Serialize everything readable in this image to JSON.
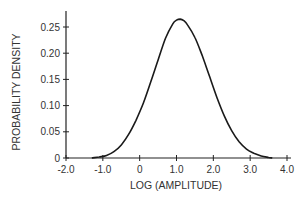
{
  "chart_data": {
    "type": "line",
    "title": "",
    "xlabel": "LOG (AMPLITUDE)",
    "ylabel": "PROBABILITY DENSITY",
    "xlim": [
      -2.0,
      4.0
    ],
    "ylim": [
      0,
      0.27
    ],
    "x_ticks": [
      -2.0,
      -1.0,
      0,
      1.0,
      2.0,
      3.0,
      4.0
    ],
    "x_tick_labels": [
      "-2.0",
      "-1.0",
      "0",
      "1.0",
      "2.0",
      "3.0",
      "4.0"
    ],
    "y_ticks": [
      0,
      0.05,
      0.1,
      0.15,
      0.2,
      0.25
    ],
    "y_tick_labels": [
      "0",
      "0.05",
      "0.10",
      "0.15",
      "0.20",
      "0.25"
    ],
    "grid": false,
    "legend": "none",
    "series": [
      {
        "name": "density",
        "x": [
          -1.3,
          -1.1,
          -0.9,
          -0.7,
          -0.5,
          -0.3,
          -0.1,
          0.1,
          0.3,
          0.5,
          0.7,
          0.9,
          1.0,
          1.1,
          1.2,
          1.3,
          1.5,
          1.7,
          1.9,
          2.1,
          2.3,
          2.5,
          2.7,
          2.9,
          3.1,
          3.3,
          3.5,
          3.6
        ],
        "y": [
          0.0,
          0.002,
          0.005,
          0.012,
          0.025,
          0.045,
          0.072,
          0.105,
          0.145,
          0.187,
          0.228,
          0.256,
          0.263,
          0.265,
          0.262,
          0.254,
          0.23,
          0.195,
          0.155,
          0.115,
          0.08,
          0.052,
          0.031,
          0.017,
          0.009,
          0.004,
          0.001,
          0.0
        ]
      }
    ]
  }
}
